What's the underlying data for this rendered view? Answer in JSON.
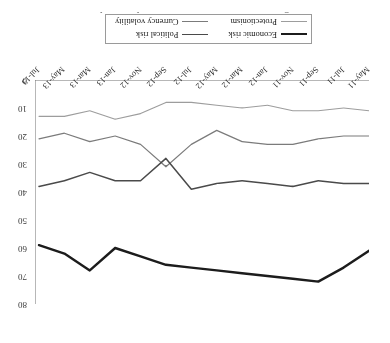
{
  "figure": {
    "caption_fragment": "and most dangerous risks. Protectionism and currency volatility remain low.",
    "orientation_note": "page-rotated-180"
  },
  "legend": {
    "position": "top-center",
    "entries": [
      {
        "label": "Economic risk",
        "color": "#1c1c1c",
        "width": 2.4
      },
      {
        "label": "Political risk",
        "color": "#4a4a4a",
        "width": 1.5
      },
      {
        "label": "Protectionism",
        "color": "#9d9d9d",
        "width": 1.1
      },
      {
        "label": "Currency volatility",
        "color": "#7b7b7b",
        "width": 1.2
      }
    ]
  },
  "yaxis": {
    "ticks": [
      "0",
      "10",
      "20",
      "30",
      "40",
      "50",
      "60",
      "70",
      "80"
    ],
    "min": 0,
    "max": 80,
    "step": 10
  },
  "chart_data": {
    "type": "line",
    "title": "",
    "subtitle": "",
    "xlabel": "",
    "ylabel": "",
    "grid": false,
    "legend_position": "top-center",
    "ylim": [
      0,
      80
    ],
    "yticks": [
      0,
      10,
      20,
      30,
      40,
      50,
      60,
      70,
      80
    ],
    "categories": [
      "May-11",
      "Jul-11",
      "Sep-11",
      "Nov-11",
      "Jan-12",
      "Mar-12",
      "May-12",
      "Jul-12",
      "Sep-12",
      "Nov-12",
      "Jan-13",
      "Mar-13",
      "May-13",
      "Jul-13"
    ],
    "series": [
      {
        "name": "Economic risk",
        "color": "#1c1c1c",
        "values": [
          61,
          67,
          72,
          71,
          70,
          69,
          68,
          67,
          66,
          63,
          60,
          68,
          62,
          59
        ]
      },
      {
        "name": "Political risk",
        "color": "#4a4a4a",
        "values": [
          37,
          37,
          36,
          38,
          37,
          36,
          37,
          39,
          28,
          36,
          36,
          33,
          36,
          38
        ]
      },
      {
        "name": "Currency volatility",
        "color": "#7b7b7b",
        "values": [
          20,
          20,
          21,
          23,
          23,
          22,
          18,
          23,
          31,
          23,
          20,
          22,
          19,
          21
        ]
      },
      {
        "name": "Protectionism",
        "color": "#9d9d9d",
        "values": [
          11,
          10,
          11,
          11,
          9,
          10,
          9,
          8,
          8,
          12,
          14,
          11,
          13,
          13
        ]
      }
    ]
  }
}
